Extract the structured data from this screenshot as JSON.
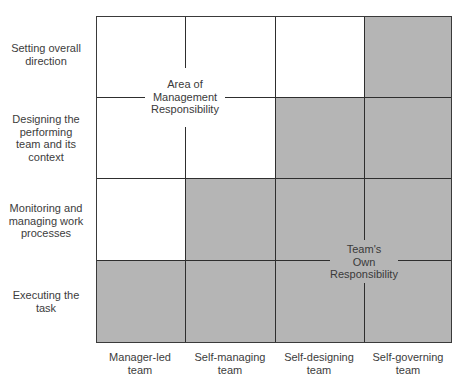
{
  "diagram": {
    "title": "",
    "rows": [
      {
        "label_lines": [
          "Setting overall",
          "direction"
        ]
      },
      {
        "label_lines": [
          "Designing the",
          "performing",
          "team and its",
          "context"
        ]
      },
      {
        "label_lines": [
          "Monitoring and",
          "managing work",
          "processes"
        ]
      },
      {
        "label_lines": [
          "Executing the",
          "task"
        ]
      }
    ],
    "row_labels": {
      "r0": "Setting overall\ndirection",
      "r1": "Designing the\nperforming\nteam and its\ncontext",
      "r2": "Monitoring and\nmanaging work\nprocesses",
      "r3": "Executing the\ntask"
    },
    "columns": [
      {
        "label": "Manager-led\nteam"
      },
      {
        "label": "Self-managing\nteam"
      },
      {
        "label": "Self-designing\nteam"
      },
      {
        "label": "Self-governing\nteam"
      }
    ],
    "column_labels": {
      "c0": "Manager-led\nteam",
      "c1": "Self-managing\nteam",
      "c2": "Self-designing\nteam",
      "c3": "Self-governing\nteam"
    },
    "regions": {
      "management": "Area of\nManagement\nResponsibility",
      "team": "Team's\nOwn\nResponsibility"
    },
    "shading_matrix": [
      [
        false,
        false,
        false,
        true
      ],
      [
        false,
        false,
        true,
        true
      ],
      [
        false,
        true,
        true,
        true
      ],
      [
        true,
        true,
        true,
        true
      ]
    ],
    "colors": {
      "shaded": "#b5b5b5",
      "unshaded": "#ffffff",
      "lines": "#2e2e2e",
      "text": "#3c3c3c"
    }
  }
}
